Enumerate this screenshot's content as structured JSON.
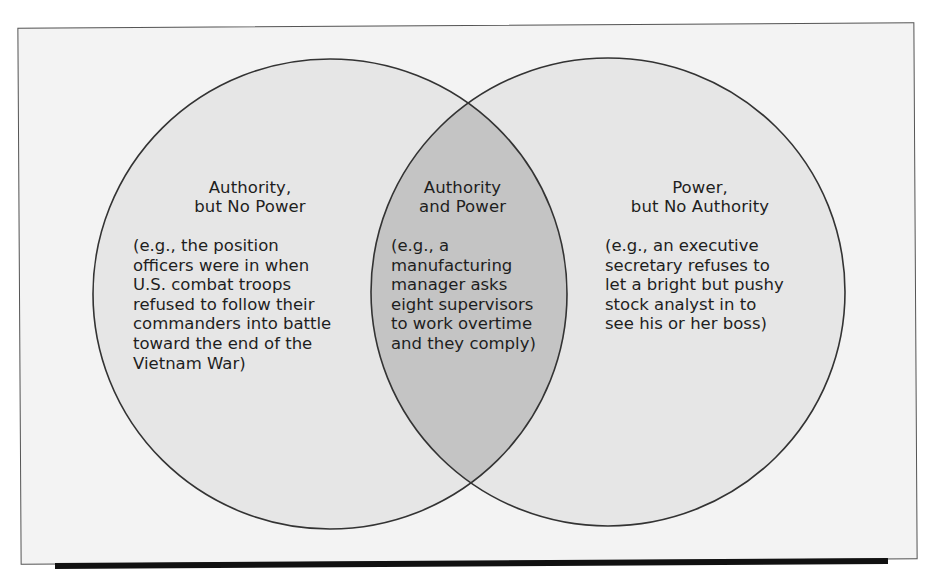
{
  "diagram": {
    "type": "venn",
    "colors": {
      "background": "#f3f3f3",
      "circle_fill": "#e6e6e6",
      "overlap_fill": "#c4c4c4",
      "stroke": "#333333",
      "frame_shadow": "#111111"
    },
    "regions": {
      "left": {
        "title_line1": "Authority,",
        "title_line2": "but No Power",
        "example": "(e.g., the position\nofficers were in when\nU.S. combat troops\nrefused to follow their\ncommanders into battle\ntoward the end of the\nVietnam War)"
      },
      "center": {
        "title_line1": "Authority",
        "title_line2": "and Power",
        "example": "(e.g., a\nmanufacturing\nmanager asks\neight supervisors\nto work overtime\nand they comply)"
      },
      "right": {
        "title_line1": "Power,",
        "title_line2": "but No Authority",
        "example": "(e.g., an executive\nsecretary refuses to\nlet a bright but pushy\nstock analyst in to\nsee his or her boss)"
      }
    }
  }
}
